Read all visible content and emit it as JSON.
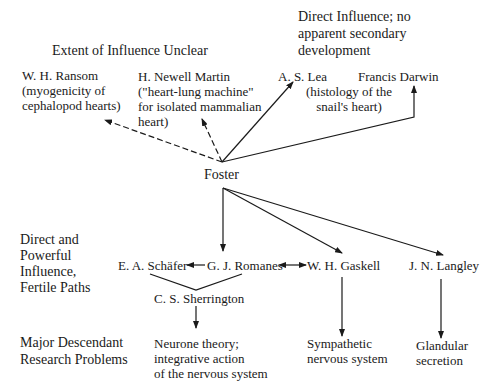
{
  "headings": {
    "unclear": "Extent of Influence Unclear",
    "direct_no_dev": [
      "Direct Influence; no",
      "apparent secondary",
      "development"
    ],
    "direct_powerful": [
      "Direct and",
      "Powerful",
      "Influence,",
      "Fertile Paths"
    ],
    "descendant": [
      "Major Descendant",
      "Research Problems"
    ]
  },
  "nodes": {
    "ransom": [
      "W. H. Ransom",
      "(myogenicity of",
      "cephalopod hearts)"
    ],
    "martin": [
      "H. Newell Martin",
      "(\"heart-lung machine\"",
      "for isolated mammalian",
      "heart)"
    ],
    "lea": "A. S. Lea",
    "lea_note": [
      "(histology of the",
      "snail's heart)"
    ],
    "darwin": "Francis Darwin",
    "foster": "Foster",
    "schafer": "E. A. Schäfer",
    "romanes": "G. J. Romanes",
    "gaskell": "W. H. Gaskell",
    "langley": "J. N. Langley",
    "sherrington": "C. S. Sherrington"
  },
  "problems": {
    "neurone": [
      "Neurone theory;",
      "integrative action",
      "of the nervous system"
    ],
    "sympathetic": [
      "Sympathetic",
      "nervous system"
    ],
    "glandular": [
      "Glandular",
      "secretion"
    ]
  },
  "colors": {
    "ink": "#1a1a1a",
    "background": "#ffffff"
  }
}
